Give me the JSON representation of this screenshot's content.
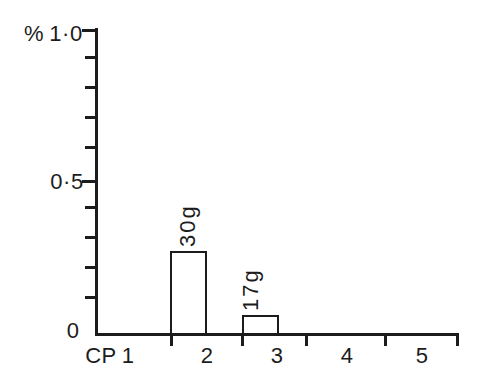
{
  "figure": {
    "background": "#ffffff",
    "ink_color": "#1c1c1c"
  },
  "chart_data": {
    "type": "bar",
    "title": "",
    "ylabel": "%",
    "xlabel": "CP",
    "categories": [
      "1",
      "2",
      "3",
      "4",
      "5"
    ],
    "values": [
      0,
      0.27,
      0.06,
      0,
      0
    ],
    "bar_annotations": [
      "",
      "30g",
      "17g",
      "",
      ""
    ],
    "ylim": [
      0,
      1.0
    ],
    "ytick_values": [
      0,
      0.5,
      1.0
    ],
    "ytick_labels": [
      "0",
      "0·5",
      "1·0"
    ],
    "minor_ytick_step": 0.1,
    "bar_fill": "#ffffff",
    "bar_outline": "#1c1c1c",
    "grid": "off",
    "legend_position": "none"
  }
}
